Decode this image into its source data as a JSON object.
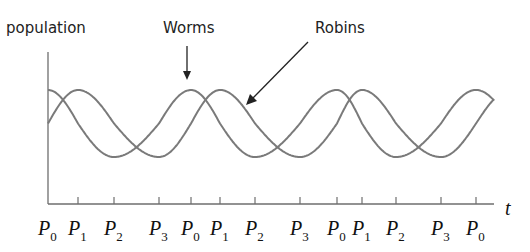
{
  "chart_data": {
    "type": "line",
    "title": "",
    "ylabel": "population",
    "xlabel": "t",
    "grid": false,
    "legend": "annotation arrows",
    "annotations": [
      {
        "text": "Worms",
        "points_to": "worms peak at second P0"
      },
      {
        "text": "Robins",
        "points_to": "robins curve descending after second P1"
      }
    ],
    "x_ticks": [
      {
        "label": "P",
        "sub": "0",
        "x": 0
      },
      {
        "label": "P",
        "sub": "1",
        "x": 1
      },
      {
        "label": "P",
        "sub": "2",
        "x": 2
      },
      {
        "label": "P",
        "sub": "3",
        "x": 3
      },
      {
        "label": "P",
        "sub": "0",
        "x": 4
      },
      {
        "label": "P",
        "sub": "1",
        "x": 5
      },
      {
        "label": "P",
        "sub": "2",
        "x": 6
      },
      {
        "label": "P",
        "sub": "3",
        "x": 7
      },
      {
        "label": "P",
        "sub": "0",
        "x": 8
      },
      {
        "label": "P",
        "sub": "1",
        "x": 9
      },
      {
        "label": "P",
        "sub": "2",
        "x": 10
      },
      {
        "label": "P",
        "sub": "3",
        "x": 11
      },
      {
        "label": "P",
        "sub": "0",
        "x": 12
      }
    ],
    "tick_pixel_x": [
      48,
      78,
      114,
      159,
      191,
      220,
      255,
      300,
      337,
      362,
      396,
      441,
      476
    ],
    "series": [
      {
        "name": "Worms",
        "shape": "periodic (cosine-like)",
        "peaks_at": "P0",
        "troughs_at": "P2",
        "color": "#7a7a7a"
      },
      {
        "name": "Robins",
        "shape": "periodic (cosine-like), lagging worms",
        "peaks_at": "P1",
        "troughs_at": "P3",
        "color": "#7a7a7a"
      }
    ],
    "period_px": 143,
    "y_peak_px": 90,
    "y_trough_px": 157,
    "axis": {
      "origin_x": 48,
      "origin_y": 204,
      "x_end": 494,
      "y_top": 52
    }
  },
  "labels": {
    "population": "population",
    "worms": "Worms",
    "robins": "Robins",
    "t": "t"
  },
  "colors": {
    "curve": "#7a7a7a",
    "axis": "#6e6e6e",
    "text": "#222222"
  }
}
